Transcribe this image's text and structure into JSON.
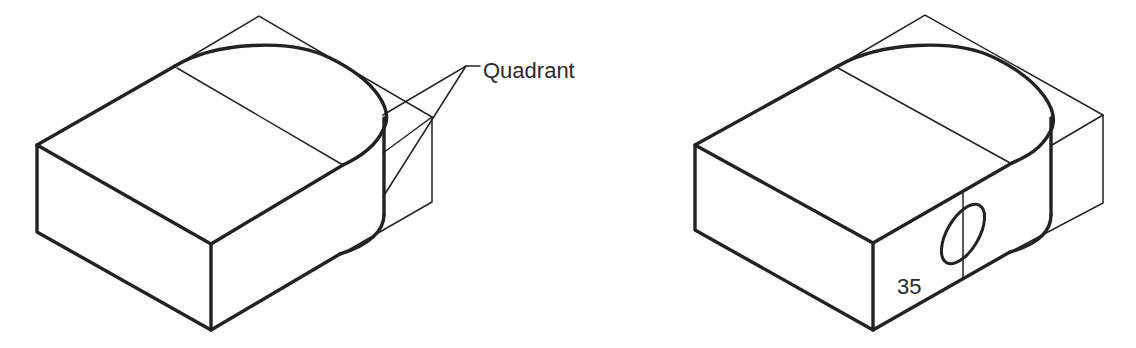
{
  "figure": {
    "left_drawing": {
      "annotation": "Quadrant"
    },
    "right_drawing": {
      "dimension_label": "35"
    },
    "colors": {
      "line": "#222222",
      "background": "#ffffff"
    }
  }
}
